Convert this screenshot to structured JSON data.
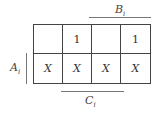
{
  "labels": {
    "B": {
      "letter": "B",
      "sub": "i"
    },
    "A": {
      "letter": "A",
      "sub": "i"
    },
    "C": {
      "letter": "C",
      "sub": "i"
    }
  },
  "kmap": {
    "rows": [
      [
        "",
        "1",
        "",
        "1"
      ],
      [
        "X",
        "X",
        "X",
        "X"
      ]
    ]
  }
}
